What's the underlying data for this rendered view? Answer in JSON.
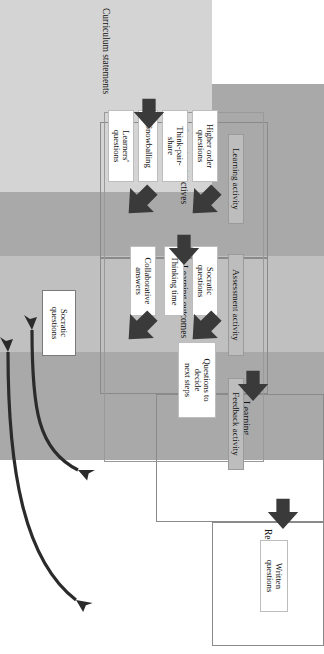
{
  "diagram": {
    "orientation": "rotated-90",
    "colors": {
      "band_dark": "#a9a9a9",
      "band_light": "#c0c0c0",
      "activity_bar": "#bdbdbd",
      "curriculum_block": "#d4d4d4",
      "arrow_dark": "#3a3a3a",
      "box_border": "#9a9a9a",
      "text": "#111111"
    }
  },
  "stages": [
    {
      "id": "curriculum-statements",
      "label": "Curriculum statements"
    },
    {
      "id": "learning-objectives",
      "label": "Learning objectives"
    },
    {
      "id": "learning-outcomes",
      "label": "Learning outcomes"
    },
    {
      "id": "learning-targets",
      "label": "Learning\ntargets"
    },
    {
      "id": "reporting",
      "label": "Reporting"
    }
  ],
  "activities": [
    {
      "id": "learning-activity",
      "label": "Learning activity"
    },
    {
      "id": "assessment-activity",
      "label": "Assessment activity"
    },
    {
      "id": "feedback-activity",
      "label": "Feedback activity"
    }
  ],
  "techniques": {
    "learning": [
      {
        "id": "higher-order-questions",
        "label": "Higher order\nquestions"
      },
      {
        "id": "think-pair-share",
        "label": "Think-pair-\nshare"
      },
      {
        "id": "snowballing",
        "label": "Snowballing"
      },
      {
        "id": "learners-questions",
        "label": "Learners'\nquestions"
      }
    ],
    "assessment": [
      {
        "id": "socratic-questions",
        "label": "Socratic\nquestions"
      },
      {
        "id": "thinking-time",
        "label": "Thinking time"
      },
      {
        "id": "collaborative-answers",
        "label": "Collaborative\nanswers"
      }
    ],
    "feedback": [
      {
        "id": "questions-to-decide-next-steps",
        "label": "Questions to\ndecide\nnext steps"
      }
    ],
    "reporting": [
      {
        "id": "written-questions",
        "label": "Written\nquestions"
      }
    ],
    "side": [
      {
        "id": "socratic-questions-side",
        "label": "Socratic\nquestions"
      }
    ]
  },
  "arrows": {
    "stage_arrows": [
      {
        "id": "arrow-curriculum-to-objectives",
        "from": "Curriculum statements",
        "to": "Learning objectives"
      },
      {
        "id": "arrow-objectives-to-outcomes",
        "from": "Learning objectives",
        "to": "Learning outcomes"
      },
      {
        "id": "arrow-outcomes-to-targets",
        "from": "Learning outcomes",
        "to": "Learning targets"
      },
      {
        "id": "arrow-targets-to-reporting",
        "from": "Learning targets",
        "to": "Reporting"
      }
    ],
    "block_arrows": [
      {
        "id": "block-arrow-learning-1"
      },
      {
        "id": "block-arrow-learning-2"
      },
      {
        "id": "block-arrow-assessment-1"
      },
      {
        "id": "block-arrow-assessment-2"
      }
    ],
    "curved_arrows": [
      {
        "id": "curved-arrow-to-reporting",
        "double_headed": true
      },
      {
        "id": "curved-arrow-to-learning-targets",
        "double_headed": true
      }
    ]
  }
}
